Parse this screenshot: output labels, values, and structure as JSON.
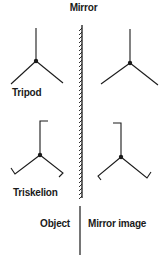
{
  "title": "Mirror",
  "labels": {
    "tripod": "Tripod",
    "triskelion": "Triskelion",
    "object": "Object",
    "mirror_image": "Mirror image"
  },
  "colors": {
    "ink": "#1a1a1a",
    "background": "#ffffff"
  }
}
